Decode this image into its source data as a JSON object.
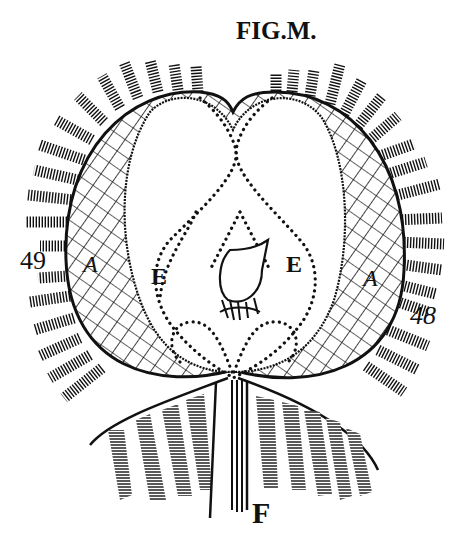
{
  "figure": {
    "title": "FIG.M.",
    "colors": {
      "ink": "#111111",
      "paper": "#ffffff"
    },
    "labels": {
      "left_number": "49",
      "right_number": "48",
      "left_region": "A",
      "right_region": "A",
      "left_chamber": "E",
      "right_chamber": "E",
      "stem": "F"
    }
  }
}
